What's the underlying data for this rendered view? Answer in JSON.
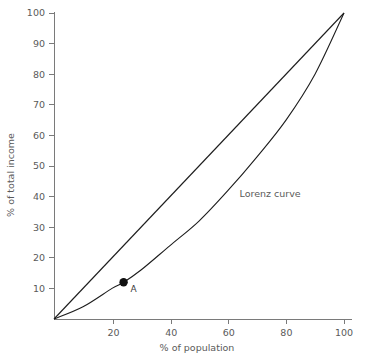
{
  "chart_data": {
    "type": "line",
    "title": "",
    "xlabel": "% of population",
    "ylabel": "% of total income",
    "xlim": [
      0,
      100
    ],
    "ylim": [
      0,
      100
    ],
    "grid": false,
    "legend_position": "inline-annotation",
    "xticks": [
      "20",
      "40",
      "60",
      "80",
      "100"
    ],
    "xtick_values": [
      20,
      40,
      60,
      80,
      100
    ],
    "yticks": [
      "10",
      "20",
      "30",
      "40",
      "50",
      "60",
      "70",
      "80",
      "90",
      "100"
    ],
    "ytick_values": [
      10,
      20,
      30,
      40,
      50,
      60,
      70,
      80,
      90,
      100
    ],
    "series": [
      {
        "name": "Line of equality",
        "annotation": "",
        "x": [
          0,
          100
        ],
        "values": [
          0,
          100
        ]
      },
      {
        "name": "Lorenz curve",
        "annotation": "Lorenz curve",
        "x": [
          0,
          10,
          20,
          24,
          30,
          40,
          50,
          60,
          70,
          80,
          90,
          100
        ],
        "values": [
          0,
          4,
          10,
          12,
          16,
          24,
          32,
          42,
          53,
          65,
          80,
          100
        ]
      }
    ],
    "annotations": [
      {
        "label": "Lorenz curve",
        "x": 64,
        "y": 40
      }
    ],
    "points": [
      {
        "label": "A",
        "x": 24,
        "y": 12,
        "marker": "filled-circle"
      }
    ],
    "colors": {
      "curve": "#1d1d1d",
      "axis": "#7a7a7a",
      "text": "#5a5a5a",
      "marker": "#111111",
      "background": "#ffffff"
    }
  }
}
